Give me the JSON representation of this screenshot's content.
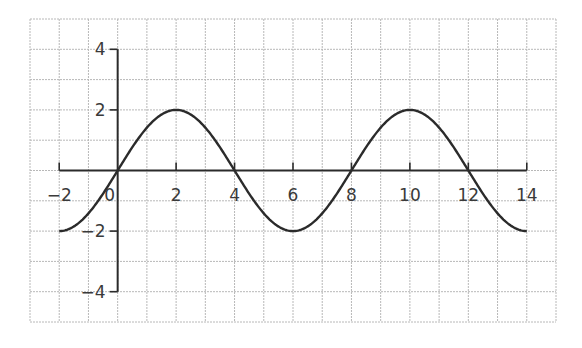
{
  "chart_data": {
    "type": "line",
    "title": "",
    "xlabel": "",
    "ylabel": "",
    "function": "y = 2 sin(pi x / 4)",
    "xlim": [
      -3,
      15
    ],
    "ylim": [
      -5,
      5
    ],
    "grid": true,
    "x_axis_range": [
      -2,
      14
    ],
    "y_axis_range": [
      -4,
      4
    ],
    "x_ticks": [
      -2,
      0,
      2,
      4,
      6,
      8,
      10,
      12,
      14
    ],
    "x_tick_labels": [
      "−2",
      "0",
      "2",
      "4",
      "6",
      "8",
      "10",
      "12",
      "14"
    ],
    "y_ticks": [
      4,
      2,
      -2,
      -4
    ],
    "y_tick_labels": [
      "4",
      "2",
      "−2",
      "−4"
    ],
    "series": [
      {
        "name": "curve",
        "x": [
          -2,
          -1,
          0,
          1,
          2,
          3,
          4,
          5,
          6,
          7,
          8,
          9,
          10,
          11,
          12,
          13,
          14
        ],
        "values": [
          -2,
          -1.41,
          0,
          1.41,
          2,
          1.41,
          0,
          -1.41,
          -2,
          -1.41,
          0,
          1.41,
          2,
          1.41,
          0,
          -1.41,
          -2
        ]
      }
    ],
    "colors": {
      "curve": "#2b2b2b",
      "axis": "#2b2b2b",
      "grid": "#b8b8b8"
    }
  }
}
